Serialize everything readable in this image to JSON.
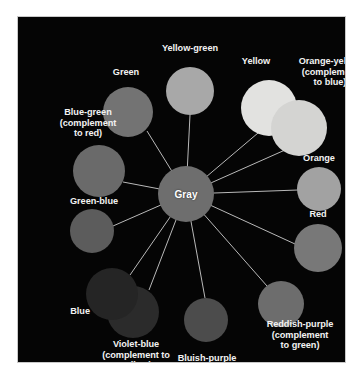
{
  "figure": {
    "kind": "color-wheel-diagram",
    "background_color": "#ffffff",
    "panel_color": "#050505",
    "panel_border_color": "#c9c9c9",
    "spoke_color": "#b9b9b9",
    "label_color": "#f2f2f2"
  },
  "hub": {
    "label": "Gray",
    "color": "#6e6e6e",
    "cx": 168,
    "cy": 177,
    "r": 28
  },
  "nodes": [
    {
      "id": "yellow-green",
      "label": "Yellow-green",
      "color": "#a8a8a8",
      "cx": 172,
      "cy": 74,
      "r": 24,
      "label_x": 116,
      "label_y": 26,
      "label_w": 112,
      "label_align": "center"
    },
    {
      "id": "yellow",
      "label": "Yellow",
      "color": "#e2e2e0",
      "cx": 251,
      "cy": 91,
      "r": 28,
      "label_x": 207,
      "label_y": 39,
      "label_w": 62,
      "label_align": "center"
    },
    {
      "id": "orange-yellow",
      "label": "Orange-yellow\n(complement\nto blue)",
      "color": "#d4d4d2",
      "cx": 281,
      "cy": 111,
      "r": 28,
      "label_x": 268,
      "label_y": 39,
      "label_w": 88,
      "label_align": "center"
    },
    {
      "id": "orange",
      "label": "Orange",
      "color": "#a2a2a2",
      "cx": 301,
      "cy": 172,
      "r": 22,
      "label_x": 263,
      "label_y": 136,
      "label_w": 76,
      "label_align": "center"
    },
    {
      "id": "red",
      "label": "Red",
      "color": "#787878",
      "cx": 300,
      "cy": 231,
      "r": 24,
      "label_x": 272,
      "label_y": 192,
      "label_w": 56,
      "label_align": "center"
    },
    {
      "id": "reddish-purple",
      "label": "Reddish-purple\n(complement\nto green)",
      "color": "#6d6d6d",
      "cx": 263,
      "cy": 287,
      "r": 23,
      "label_x": 233,
      "label_y": 302,
      "label_w": 98,
      "label_align": "center"
    },
    {
      "id": "bluish-purple",
      "label": "Bluish-purple",
      "color": "#4c4c4c",
      "cx": 188,
      "cy": 303,
      "r": 22,
      "label_x": 133,
      "label_y": 336,
      "label_w": 112,
      "label_align": "center"
    },
    {
      "id": "violet-blue",
      "label": "Violet-blue\n(complement to\nyellow)",
      "color": "#2b2b2b",
      "cx": 115,
      "cy": 295,
      "r": 26,
      "label_x": 57,
      "label_y": 322,
      "label_w": 122,
      "label_align": "center"
    },
    {
      "id": "blue",
      "label": "Blue",
      "color": "#252525",
      "cx": 94,
      "cy": 277,
      "r": 26,
      "label_x": 34,
      "label_y": 289,
      "label_w": 38,
      "label_align": "right"
    },
    {
      "id": "green-blue",
      "label": "Green-blue",
      "color": "#5c5c5c",
      "cx": 74,
      "cy": 214,
      "r": 22,
      "label_x": 30,
      "label_y": 179,
      "label_w": 92,
      "label_align": "center"
    },
    {
      "id": "blue-green",
      "label": "Blue-green\n(complement\nto red)",
      "color": "#6a6a6a",
      "cx": 81,
      "cy": 154,
      "r": 26,
      "label_x": 24,
      "label_y": 90,
      "label_w": 92,
      "label_align": "center"
    },
    {
      "id": "green",
      "label": "Green",
      "color": "#737373",
      "cx": 110,
      "cy": 95,
      "r": 25,
      "label_x": 74,
      "label_y": 50,
      "label_w": 68,
      "label_align": "center"
    }
  ],
  "spokes": [
    {
      "id": "spoke-yellow-green",
      "x2": 172,
      "y2": 98
    },
    {
      "id": "spoke-yellow",
      "x2": 240,
      "y2": 116
    },
    {
      "id": "spoke-orange-yellow",
      "x2": 267,
      "y2": 133
    },
    {
      "id": "spoke-orange",
      "x2": 280,
      "y2": 173
    },
    {
      "id": "spoke-red",
      "x2": 277,
      "y2": 227
    },
    {
      "id": "spoke-reddish-purple",
      "x2": 249,
      "y2": 269
    },
    {
      "id": "spoke-bluish-purple",
      "x2": 187,
      "y2": 281
    },
    {
      "id": "spoke-violet-blue",
      "x2": 131,
      "y2": 273
    },
    {
      "id": "spoke-blue",
      "x2": 112,
      "y2": 258
    },
    {
      "id": "spoke-green-blue",
      "x2": 95,
      "y2": 209
    },
    {
      "id": "spoke-blue-green",
      "x2": 105,
      "y2": 165
    },
    {
      "id": "spoke-green",
      "x2": 129,
      "y2": 114
    }
  ]
}
